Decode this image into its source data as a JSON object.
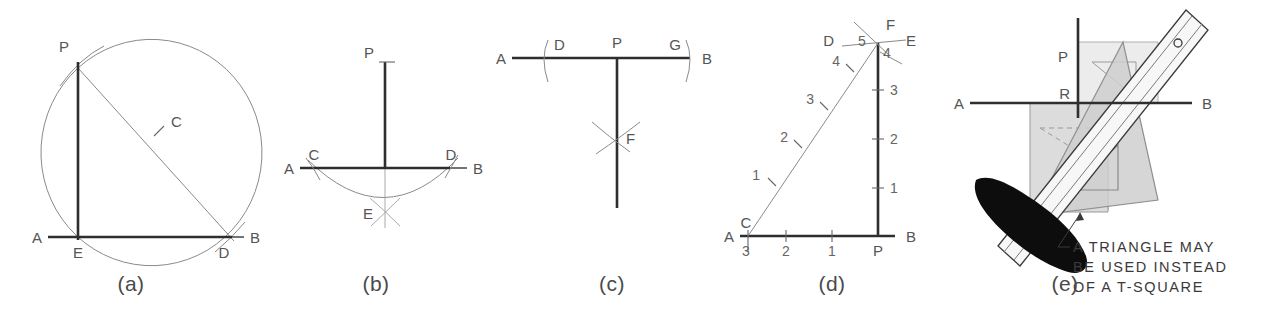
{
  "figure": {
    "background": "#ffffff",
    "ink_color": "#2e2e2e",
    "construction_color": "#8a8a8a"
  },
  "panels": [
    {
      "id": "a",
      "caption": "(a)",
      "description": "Perpendicular erected at point E on line AB using a semicircle through P",
      "labels": [
        {
          "text": "P",
          "role": "given-point"
        },
        {
          "text": "C",
          "role": "center-of-arc"
        },
        {
          "text": "A",
          "role": "line-end-left"
        },
        {
          "text": "E",
          "role": "foot-of-perpendicular"
        },
        {
          "text": "D",
          "role": "arc-intersection"
        },
        {
          "text": "B",
          "role": "line-end-right"
        }
      ]
    },
    {
      "id": "b",
      "caption": "(b)",
      "description": "Perpendicular from point P to line AB by swinging arcs from C and D to locate E",
      "labels": [
        {
          "text": "P",
          "role": "given-point"
        },
        {
          "text": "A",
          "role": "line-end-left"
        },
        {
          "text": "C",
          "role": "arc-intersection-left"
        },
        {
          "text": "D",
          "role": "arc-intersection-right"
        },
        {
          "text": "B",
          "role": "line-end-right"
        },
        {
          "text": "E",
          "role": "crossing-arcs-point"
        }
      ]
    },
    {
      "id": "c",
      "caption": "(c)",
      "description": "Perpendicular erected at P on line AB using arcs D and G crossing at F",
      "labels": [
        {
          "text": "A",
          "role": "line-end-left"
        },
        {
          "text": "D",
          "role": "arc-left"
        },
        {
          "text": "P",
          "role": "given-point"
        },
        {
          "text": "G",
          "role": "arc-right"
        },
        {
          "text": "B",
          "role": "line-end-right"
        },
        {
          "text": "F",
          "role": "crossing-arcs-point"
        }
      ]
    },
    {
      "id": "d",
      "caption": "(d)",
      "description": "Perpendicular by the 3-4-5 right triangle method",
      "labels": [
        {
          "text": "D",
          "role": "arc-left"
        },
        {
          "text": "5",
          "role": "hypotenuse-count"
        },
        {
          "text": "F",
          "role": "apex"
        },
        {
          "text": "4",
          "role": "vertical-count"
        },
        {
          "text": "E",
          "role": "arc-right"
        },
        {
          "text": "A",
          "role": "line-end-left"
        },
        {
          "text": "C",
          "role": "triangle-corner"
        },
        {
          "text": "3",
          "role": "base-count"
        },
        {
          "text": "P",
          "role": "foot-point"
        },
        {
          "text": "B",
          "role": "line-end-right"
        }
      ],
      "base_divisions": [
        "3",
        "2",
        "1"
      ],
      "vertical_divisions": [
        "1",
        "2",
        "3"
      ],
      "hypotenuse_divisions": [
        "1",
        "2",
        "3",
        "4"
      ]
    },
    {
      "id": "e",
      "caption": "(e)",
      "description": "Drawing a perpendicular with two triangles and a straightedge",
      "labels": [
        {
          "text": "P",
          "role": "given-point"
        },
        {
          "text": "R",
          "role": "foot-of-perpendicular"
        },
        {
          "text": "A",
          "role": "line-end-left"
        },
        {
          "text": "B",
          "role": "line-end-right"
        }
      ],
      "note_lines": [
        "A TRIANGLE MAY",
        "BE USED INSTEAD",
        "OF A T-SQUARE"
      ]
    }
  ]
}
